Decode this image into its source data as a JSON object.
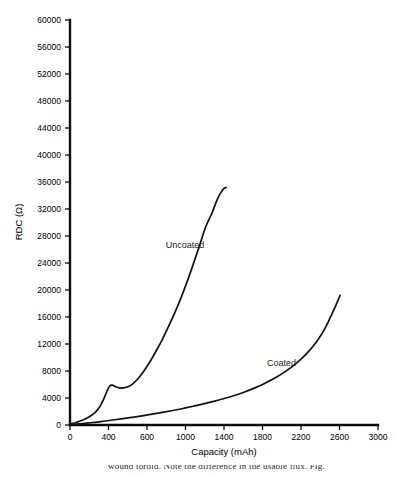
{
  "figure": {
    "background_color": "#ffffff",
    "line_color": "#111111",
    "caption_fragment": "wound toroid. Note the difference in the usable flux. Fig."
  },
  "chart_data": {
    "type": "line",
    "title": "",
    "xlabel": "Capacity (mAh)",
    "ylabel": "RDC (Ω)",
    "xlim": [
      0,
      3000
    ],
    "ylim": [
      0,
      60000
    ],
    "grid": false,
    "legend_position": "inline-annotation",
    "x_ticks": [
      0,
      400,
      600,
      1000,
      1400,
      1800,
      2200,
      2600,
      3000
    ],
    "x_tick_labels": [
      "0",
      "400",
      "600",
      "1000",
      "1400",
      "1800",
      "2200",
      "2600",
      "3000"
    ],
    "y_ticks": [
      0,
      4000,
      8000,
      12000,
      16000,
      20000,
      24000,
      28000,
      32000,
      36000,
      40000,
      44000,
      48000,
      52000,
      56000,
      60000
    ],
    "y_tick_labels": [
      "0",
      "4000",
      "8000",
      "12000",
      "16000",
      "20000",
      "24000",
      "28000",
      "32000",
      "36000",
      "40000",
      "44000",
      "48000",
      "52000",
      "56000",
      "60000"
    ],
    "series": [
      {
        "name": "Uncoated",
        "label_x": 1120,
        "label_y": 26200,
        "x": [
          10,
          60,
          120,
          180,
          240,
          290,
          330,
          360,
          385,
          410,
          440,
          480,
          520,
          570,
          620,
          670,
          720,
          780,
          840,
          900,
          960,
          1020,
          1080,
          1140,
          1200,
          1260,
          1320,
          1380,
          1440,
          1490,
          1520
        ],
        "y": [
          150,
          380,
          700,
          1150,
          1800,
          2700,
          3900,
          5000,
          5750,
          5900,
          5700,
          5500,
          5500,
          5700,
          6200,
          7000,
          8000,
          9400,
          11000,
          12700,
          14600,
          16600,
          18800,
          21200,
          23800,
          26500,
          29300,
          31300,
          33600,
          34900,
          35200
        ]
      },
      {
        "name": "Coated",
        "label_x": 2060,
        "label_y": 8800,
        "x": [
          10,
          100,
          200,
          300,
          400,
          500,
          600,
          700,
          800,
          900,
          1000,
          1100,
          1200,
          1300,
          1400,
          1500,
          1600,
          1700,
          1800,
          1900,
          2000,
          2100,
          2200,
          2300,
          2400,
          2480,
          2550,
          2600,
          2630
        ],
        "y": [
          60,
          180,
          330,
          500,
          700,
          900,
          1120,
          1350,
          1600,
          1870,
          2150,
          2450,
          2780,
          3120,
          3500,
          3920,
          4380,
          4900,
          5500,
          6200,
          7000,
          7950,
          9100,
          10500,
          12300,
          14200,
          16400,
          18100,
          19200
        ]
      }
    ]
  }
}
